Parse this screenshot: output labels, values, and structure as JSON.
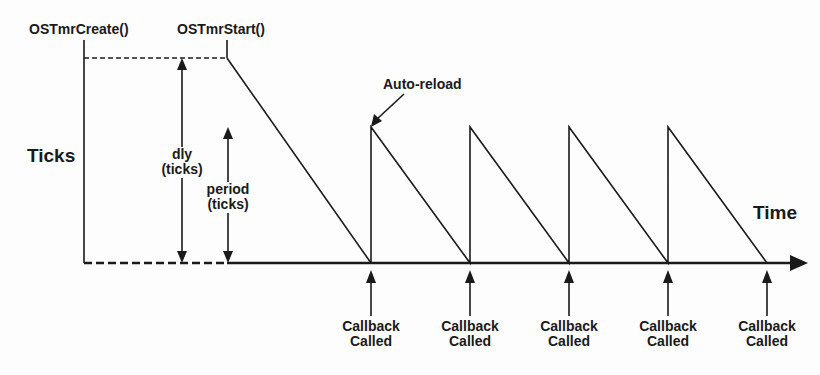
{
  "diagram": {
    "labels": {
      "create_call": "OSTmrCreate()",
      "start_call": "OSTmrStart()",
      "y_axis": "Ticks",
      "x_axis": "Time",
      "dly_line1": "dly",
      "dly_line2": "(ticks)",
      "period_line1": "period",
      "period_line2": "(ticks)",
      "auto_reload": "Auto-reload"
    },
    "callbacks": [
      {
        "line1": "Callback",
        "line2": "Called"
      },
      {
        "line1": "Callback",
        "line2": "Called"
      },
      {
        "line1": "Callback",
        "line2": "Called"
      },
      {
        "line1": "Callback",
        "line2": "Called"
      },
      {
        "line1": "Callback",
        "line2": "Called"
      }
    ],
    "colors": {
      "ink": "#1a1a1a",
      "background": "#fdfdfd"
    }
  }
}
